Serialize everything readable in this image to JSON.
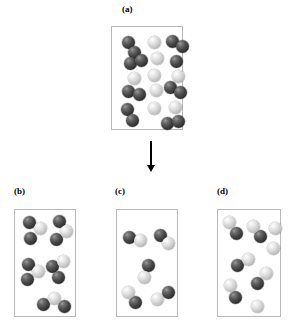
{
  "figure": {
    "title": "Molecular reaction diagram"
  },
  "colors": {
    "dark_atom": "#333333",
    "light_atom": "#dcdcdc",
    "panel_border": "#b9b9b9",
    "arrow": "#000000",
    "background": "#ffffff"
  },
  "panels": {
    "a": {
      "label": "(a)",
      "label_x": 122,
      "label_y": 4,
      "box": {
        "x": 111,
        "y": 26,
        "w": 72,
        "h": 104
      },
      "atom_radius": 6.5,
      "molecules": [
        {
          "type": "dark-dimer",
          "atoms": [
            {
              "kind": "dark",
              "x": 10,
              "y": 9
            },
            {
              "kind": "dark",
              "x": 16,
              "y": 19
            }
          ]
        },
        {
          "type": "light-atom",
          "atoms": [
            {
              "kind": "light",
              "x": 36,
              "y": 9
            }
          ]
        },
        {
          "type": "dark-dimer",
          "atoms": [
            {
              "kind": "dark",
              "x": 54,
              "y": 8
            },
            {
              "kind": "dark",
              "x": 64,
              "y": 13
            }
          ]
        },
        {
          "type": "dark-dimer",
          "atoms": [
            {
              "kind": "dark",
              "x": 12,
              "y": 30
            },
            {
              "kind": "dark",
              "x": 23,
              "y": 27
            }
          ]
        },
        {
          "type": "light-atom",
          "atoms": [
            {
              "kind": "light",
              "x": 39,
              "y": 25
            }
          ]
        },
        {
          "type": "dark-atom-pair",
          "atoms": [
            {
              "kind": "dark",
              "x": 58,
              "y": 28
            }
          ]
        },
        {
          "type": "light-atom",
          "atoms": [
            {
              "kind": "light",
              "x": 16,
              "y": 45
            }
          ]
        },
        {
          "type": "light-atom",
          "atoms": [
            {
              "kind": "light",
              "x": 36,
              "y": 42
            }
          ]
        },
        {
          "type": "light-atom",
          "atoms": [
            {
              "kind": "light",
              "x": 60,
              "y": 43
            }
          ]
        },
        {
          "type": "dark-dimer",
          "atoms": [
            {
              "kind": "dark",
              "x": 10,
              "y": 58
            },
            {
              "kind": "dark",
              "x": 21,
              "y": 61
            }
          ]
        },
        {
          "type": "light-atom",
          "atoms": [
            {
              "kind": "light",
              "x": 38,
              "y": 57
            }
          ]
        },
        {
          "type": "dark-dimer",
          "atoms": [
            {
              "kind": "dark",
              "x": 52,
              "y": 54
            },
            {
              "kind": "dark",
              "x": 62,
              "y": 59
            }
          ]
        },
        {
          "type": "dark-dimer",
          "atoms": [
            {
              "kind": "dark",
              "x": 9,
              "y": 76
            },
            {
              "kind": "dark",
              "x": 14,
              "y": 87
            }
          ]
        },
        {
          "type": "light-atom",
          "atoms": [
            {
              "kind": "light",
              "x": 36,
              "y": 75
            }
          ]
        },
        {
          "type": "light-atom",
          "atoms": [
            {
              "kind": "light",
              "x": 57,
              "y": 74
            }
          ]
        },
        {
          "type": "dark-dimer",
          "atoms": [
            {
              "kind": "dark",
              "x": 49,
              "y": 90
            },
            {
              "kind": "dark",
              "x": 60,
              "y": 88
            }
          ]
        }
      ]
    },
    "b": {
      "label": "(b)",
      "label_x": 14,
      "label_y": 186,
      "box": {
        "x": 14,
        "y": 209,
        "w": 62,
        "h": 108
      },
      "atom_radius": 6.5,
      "molecules": [
        {
          "type": "triatomic",
          "atoms": [
            {
              "kind": "dark",
              "x": 8,
              "y": 6
            },
            {
              "kind": "light",
              "x": 19,
              "y": 12
            },
            {
              "kind": "dark",
              "x": 9,
              "y": 22
            }
          ]
        },
        {
          "type": "triatomic",
          "atoms": [
            {
              "kind": "dark",
              "x": 38,
              "y": 5
            },
            {
              "kind": "light",
              "x": 45,
              "y": 15
            },
            {
              "kind": "dark",
              "x": 35,
              "y": 23
            }
          ]
        },
        {
          "type": "triatomic",
          "atoms": [
            {
              "kind": "dark",
              "x": 7,
              "y": 48
            },
            {
              "kind": "light",
              "x": 17,
              "y": 55
            },
            {
              "kind": "dark",
              "x": 6,
              "y": 63
            }
          ]
        },
        {
          "type": "triatomic",
          "atoms": [
            {
              "kind": "light",
              "x": 42,
              "y": 45
            },
            {
              "kind": "dark",
              "x": 31,
              "y": 50
            },
            {
              "kind": "dark",
              "x": 37,
              "y": 61
            }
          ]
        },
        {
          "type": "triatomic",
          "atoms": [
            {
              "kind": "light",
              "x": 33,
              "y": 82
            },
            {
              "kind": "dark",
              "x": 22,
              "y": 88
            },
            {
              "kind": "dark",
              "x": 43,
              "y": 90
            }
          ]
        }
      ]
    },
    "c": {
      "label": "(c)",
      "label_x": 115,
      "label_y": 186,
      "box": {
        "x": 116,
        "y": 209,
        "w": 62,
        "h": 108
      },
      "atom_radius": 6.5,
      "molecules": [
        {
          "type": "heterodimer",
          "atoms": [
            {
              "kind": "dark",
              "x": 6,
              "y": 21
            },
            {
              "kind": "light",
              "x": 17,
              "y": 24
            }
          ]
        },
        {
          "type": "heterodimer",
          "atoms": [
            {
              "kind": "dark",
              "x": 37,
              "y": 19
            },
            {
              "kind": "light",
              "x": 45,
              "y": 27
            }
          ]
        },
        {
          "type": "heterodimer",
          "atoms": [
            {
              "kind": "dark",
              "x": 25,
              "y": 49
            },
            {
              "kind": "light",
              "x": 21,
              "y": 61
            }
          ]
        },
        {
          "type": "heterodimer",
          "atoms": [
            {
              "kind": "light",
              "x": 5,
              "y": 76
            },
            {
              "kind": "dark",
              "x": 12,
              "y": 86
            }
          ]
        },
        {
          "type": "heterodimer",
          "atoms": [
            {
              "kind": "dark",
              "x": 45,
              "y": 76
            },
            {
              "kind": "light",
              "x": 34,
              "y": 83
            }
          ]
        }
      ]
    },
    "d": {
      "label": "(d)",
      "label_x": 217,
      "label_y": 186,
      "box": {
        "x": 217,
        "y": 209,
        "w": 64,
        "h": 108
      },
      "atom_radius": 6.5,
      "molecules": [
        {
          "type": "heterodimer",
          "atoms": [
            {
              "kind": "light",
              "x": 5,
              "y": 6
            },
            {
              "kind": "dark",
              "x": 12,
              "y": 17
            }
          ]
        },
        {
          "type": "heterodimer",
          "atoms": [
            {
              "kind": "light",
              "x": 29,
              "y": 10
            },
            {
              "kind": "dark",
              "x": 36,
              "y": 20
            }
          ]
        },
        {
          "type": "light-atom",
          "atoms": [
            {
              "kind": "light",
              "x": 51,
              "y": 12
            }
          ]
        },
        {
          "type": "light-atom",
          "atoms": [
            {
              "kind": "light",
              "x": 49,
              "y": 32
            }
          ]
        },
        {
          "type": "heterodimer",
          "atoms": [
            {
              "kind": "light",
              "x": 24,
              "y": 43
            },
            {
              "kind": "dark",
              "x": 13,
              "y": 49
            }
          ]
        },
        {
          "type": "heterodimer",
          "atoms": [
            {
              "kind": "light",
              "x": 42,
              "y": 57
            },
            {
              "kind": "dark",
              "x": 33,
              "y": 67
            }
          ]
        },
        {
          "type": "heterodimer",
          "atoms": [
            {
              "kind": "light",
              "x": 6,
              "y": 69
            },
            {
              "kind": "dark",
              "x": 11,
              "y": 81
            }
          ]
        },
        {
          "type": "light-atom",
          "atoms": [
            {
              "kind": "light",
              "x": 33,
              "y": 90
            }
          ]
        }
      ]
    }
  },
  "arrow": {
    "name": "downward-reaction-arrow",
    "x": 147,
    "y": 141,
    "length": 31,
    "direction": "down"
  }
}
